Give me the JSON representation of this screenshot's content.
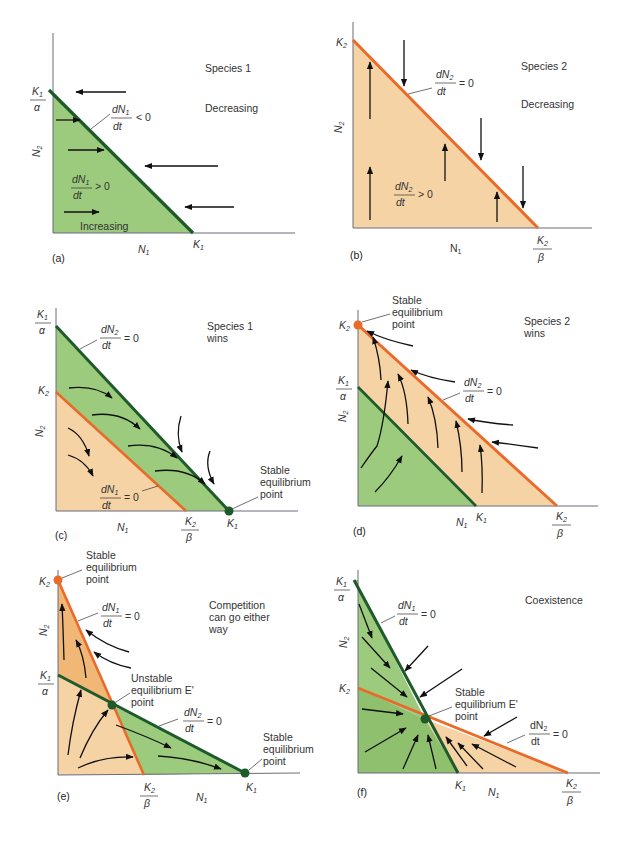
{
  "figure": {
    "colors": {
      "green_fill": "#9ccb7e",
      "green_line": "#1f5a2a",
      "orange_fill": "#f6d3a5",
      "orange_fill_dark": "#f0b777",
      "orange_line": "#ea6a2a",
      "axis": "#6b6b80",
      "arrow": "#111111",
      "text": "#333333"
    },
    "panels": [
      {
        "id": "a",
        "letter": "(a)",
        "title": "Species 1",
        "top_label": "Decreasing",
        "bottom_label": "Increasing",
        "isocline": "dN1/dt < 0",
        "isocline_num": "dN",
        "isocline_sub": "1",
        "isocline_den": "dt",
        "isocline_rel": "< 0",
        "inside_num": "dN",
        "inside_sub": "1",
        "inside_den": "dt",
        "inside_rel": "> 0",
        "y_axis": "N",
        "y_axis_sub": "2",
        "x_axis": "N",
        "x_axis_sub": "1",
        "y_intercept_num": "K",
        "y_intercept_sub": "1",
        "y_intercept_den": "α",
        "x_intercept": "K",
        "x_intercept_sub": "1"
      },
      {
        "id": "b",
        "letter": "(b)",
        "title": "Species 2",
        "top_label": "Decreasing",
        "isocline_num": "dN",
        "isocline_sub": "2",
        "isocline_den": "dt",
        "isocline_rel": "=  0",
        "inside_num": "dN",
        "inside_sub": "2",
        "inside_den": "dt",
        "inside_rel": "> 0",
        "y_axis": "N",
        "y_axis_sub": "2",
        "x_axis": "N",
        "x_axis_sub": "1",
        "y_intercept": "K",
        "y_intercept_sub": "2",
        "x_intercept_num": "K",
        "x_intercept_sub": "2",
        "x_intercept_den": "β"
      },
      {
        "id": "c",
        "letter": "(c)",
        "title_line1": "Species 1",
        "title_line2": "wins",
        "green_iso_num": "dN",
        "green_iso_sub": "2",
        "green_iso_den": "dt",
        "green_iso_rel": "= 0",
        "orange_iso_num": "dN",
        "orange_iso_sub": "1",
        "orange_iso_den": "dt",
        "orange_iso_rel": "= 0",
        "eq_line1": "Stable",
        "eq_line2": "equilibrium",
        "eq_line3": "point",
        "y_top_num": "K",
        "y_top_sub": "1",
        "y_top_den": "α",
        "y_mid": "K",
        "y_mid_sub": "2",
        "x_mid_num": "K",
        "x_mid_sub": "2",
        "x_mid_den": "β",
        "x_end": "K",
        "x_end_sub": "1",
        "y_axis": "N",
        "y_axis_sub": "2",
        "x_axis": "N",
        "x_axis_sub": "1"
      },
      {
        "id": "d",
        "letter": "(d)",
        "title_line1": "Species 2",
        "title_line2": "wins",
        "eq_line1": "Stable",
        "eq_line2": "equilibrium",
        "eq_line3": "point",
        "orange_iso_num": "dN",
        "orange_iso_sub": "2",
        "orange_iso_den": "dt",
        "orange_iso_rel": "= 0",
        "y_top": "K",
        "y_top_sub": "2",
        "y_mid_num": "K",
        "y_mid_sub": "1",
        "y_mid_den": "α",
        "x_mid": "K",
        "x_mid_sub": "1",
        "x_end_num": "K",
        "x_end_sub": "2",
        "x_end_den": "β",
        "y_axis": "N",
        "y_axis_sub": "2",
        "x_axis": "N",
        "x_axis_sub": "1"
      },
      {
        "id": "e",
        "letter": "(e)",
        "title_line1": "Competition",
        "title_line2": "can go either",
        "title_line3": "way",
        "eq_top_line1": "Stable",
        "eq_top_line2": "equilibrium",
        "eq_top_line3": "point",
        "unstable_line1": "Unstable",
        "unstable_line2": "equilibrium  E'",
        "unstable_line3": "point",
        "eq_right_line1": "Stable",
        "eq_right_line2": "equilibrium",
        "eq_right_line3": "point",
        "orange_iso_num": "dN",
        "orange_iso_sub": "1",
        "orange_iso_den": "dt",
        "orange_iso_rel": "= 0",
        "green_iso_num": "dN",
        "green_iso_sub": "2",
        "green_iso_den": "dt",
        "green_iso_rel": "= 0",
        "y_top": "K",
        "y_top_sub": "2",
        "y_mid_num": "K",
        "y_mid_sub": "1",
        "y_mid_den": "α",
        "x_mid_num": "K",
        "x_mid_sub": "2",
        "x_mid_den": "β",
        "x_end": "K",
        "x_end_sub": "1",
        "y_axis": "N",
        "y_axis_sub": "2",
        "x_axis": "N",
        "x_axis_sub": "1"
      },
      {
        "id": "f",
        "letter": "(f)",
        "title": "Coexistence",
        "eq_line1": "Stable",
        "eq_line2": "equilibrium  E'",
        "eq_line3": "point",
        "green_iso_num": "dN",
        "green_iso_sub": "1",
        "green_iso_den": "dt",
        "green_iso_rel": "= 0",
        "orange_iso_num": "dN",
        "orange_iso_sub": "2",
        "orange_iso_den": "dt",
        "orange_iso_rel": "= 0",
        "y_top_num": "K",
        "y_top_sub": "1",
        "y_top_den": "α",
        "y_mid": "K",
        "y_mid_sub": "2",
        "x_mid": "K",
        "x_mid_sub": "1",
        "x_end_num": "K",
        "x_end_sub": "2",
        "x_end_den": "β",
        "y_axis": "N",
        "y_axis_sub": "2",
        "x_axis": "N",
        "x_axis_sub": "1"
      }
    ]
  }
}
